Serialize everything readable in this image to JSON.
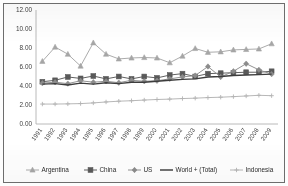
{
  "chart_data": {
    "type": "line",
    "title": "",
    "xlabel": "",
    "ylabel": "",
    "ylim": [
      0,
      12
    ],
    "yticks": [
      "0.00",
      "2.00",
      "4.00",
      "6.00",
      "8.00",
      "10.00",
      "12.00"
    ],
    "grid": false,
    "legend_position": "bottom",
    "categories": [
      "1991",
      "1992",
      "1993",
      "1994",
      "1995",
      "1996",
      "1997",
      "1998",
      "1999",
      "2000",
      "2001",
      "2002",
      "2003",
      "2004",
      "2005",
      "2006",
      "2007",
      "2008",
      "2009"
    ],
    "series": [
      {
        "name": "Argentina",
        "marker": "triangle",
        "color": "#a6a6a6",
        "values": [
          6.6,
          8.1,
          7.35,
          6.1,
          8.55,
          7.35,
          6.85,
          6.95,
          7.0,
          6.95,
          6.45,
          7.15,
          7.95,
          7.55,
          7.6,
          7.8,
          7.85,
          7.9,
          8.45
        ]
      },
      {
        "name": "China",
        "marker": "square",
        "color": "#595959",
        "values": [
          4.45,
          4.6,
          4.95,
          4.8,
          5.05,
          4.75,
          5.0,
          4.75,
          5.0,
          4.85,
          5.15,
          5.3,
          5.0,
          5.3,
          5.35,
          5.4,
          5.45,
          5.45,
          5.55
        ]
      },
      {
        "name": "US",
        "marker": "diamond",
        "color": "#8c8c8c",
        "values": [
          4.3,
          4.4,
          4.25,
          4.55,
          4.4,
          4.5,
          4.35,
          4.6,
          4.5,
          4.55,
          4.75,
          4.95,
          5.1,
          6.05,
          4.95,
          5.55,
          6.35,
          5.7,
          5.25
        ]
      },
      {
        "name": "World + (Total)",
        "marker": "none",
        "color": "#3d3d3d",
        "values": [
          4.2,
          4.25,
          4.1,
          4.3,
          4.2,
          4.35,
          4.25,
          4.4,
          4.4,
          4.5,
          4.6,
          4.7,
          4.75,
          4.95,
          5.0,
          5.1,
          5.15,
          5.2,
          5.25
        ]
      },
      {
        "name": "Indonesia",
        "marker": "cross",
        "color": "#b3b3b3",
        "values": [
          2.1,
          2.1,
          2.12,
          2.15,
          2.22,
          2.32,
          2.4,
          2.45,
          2.52,
          2.58,
          2.62,
          2.68,
          2.72,
          2.78,
          2.82,
          2.88,
          2.95,
          3.02,
          2.98
        ]
      }
    ]
  },
  "legend": {
    "items": [
      {
        "label": "Argentina"
      },
      {
        "label": "China"
      },
      {
        "label": "US"
      },
      {
        "label": "World + (Total)"
      },
      {
        "label": "Indonesia"
      }
    ]
  }
}
